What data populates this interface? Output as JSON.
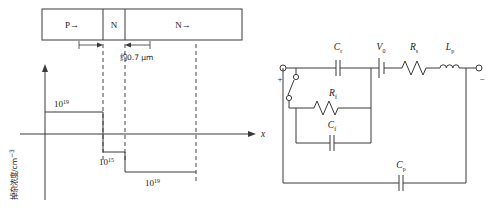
{
  "figure": {
    "stroke_color": "#3a3a3a",
    "text_color": "#1a1a1a",
    "background": "#ffffff"
  },
  "doping_diagram": {
    "name": "doping-profile-diagram",
    "structure_regions": [
      {
        "id": "region-p",
        "label": "P→"
      },
      {
        "id": "region-n-thin",
        "label": "N"
      },
      {
        "id": "region-n-wide",
        "label": "N→"
      }
    ],
    "dimension_annotation": "约0.7 μm",
    "y_axis_label_main": "掉杂浓度/cm",
    "y_axis_label_exponent": "−3",
    "x_axis_label": "x",
    "profile_labels": [
      {
        "id": "level-p-plus",
        "base": "10",
        "exponent": "19"
      },
      {
        "id": "level-n-low",
        "base": "10",
        "exponent": "15"
      },
      {
        "id": "level-n-plus",
        "base": "10",
        "exponent": "19"
      }
    ]
  },
  "circuit_diagram": {
    "name": "equivalent-circuit-diagram",
    "terminal_positive": "+",
    "terminal_negative": "−",
    "components": [
      {
        "id": "switch",
        "label": "",
        "type": "switch-open"
      },
      {
        "id": "cap-r",
        "base": "C",
        "sub": "r",
        "type": "capacitor"
      },
      {
        "id": "source-v0",
        "base": "V",
        "sub": "0",
        "type": "voltage-source"
      },
      {
        "id": "res-s",
        "base": "R",
        "sub": "s",
        "type": "resistor"
      },
      {
        "id": "ind-p",
        "base": "L",
        "sub": "p",
        "type": "inductor"
      },
      {
        "id": "res-f",
        "base": "R",
        "sub": "f",
        "type": "resistor"
      },
      {
        "id": "cap-f",
        "base": "C",
        "sub": "f",
        "type": "capacitor"
      },
      {
        "id": "cap-p",
        "base": "C",
        "sub": "p",
        "type": "capacitor"
      }
    ]
  }
}
